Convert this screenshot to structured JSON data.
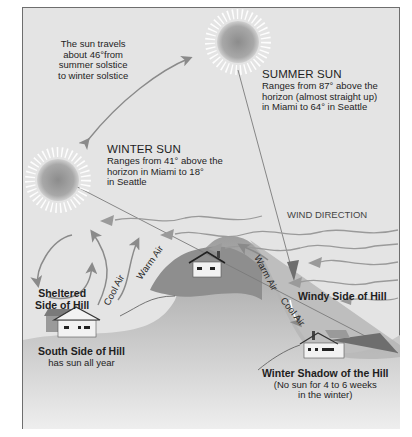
{
  "diagram": {
    "travel_note": [
      "The sun travels",
      "about 46°from",
      "summer solstice",
      "to winter solstice"
    ],
    "summer_sun": {
      "title": "SUMMER SUN",
      "lines": [
        "Ranges from 87° above the",
        "horizon (almost straight up)",
        "in Miami to 64° in Seattle"
      ]
    },
    "winter_sun": {
      "title": "WINTER SUN",
      "lines": [
        "Ranges from 41° above the",
        "horizon in Miami to 18°",
        "in Seattle"
      ]
    },
    "wind_direction": "WIND DIRECTION",
    "air_labels": {
      "warm_air_left": "Warm Air",
      "cool_air_left": "Cool Air",
      "warm_air_right": "Warm Air",
      "cool_air_right": "Cool Air"
    },
    "sheltered": [
      "Sheltered",
      "Side of Hill"
    ],
    "south_side": {
      "title": "South Side of Hill",
      "sub": "has sun all year"
    },
    "windy_side": "Windy Side of Hill",
    "winter_shadow": {
      "title": "Winter Shadow of the Hill",
      "lines": [
        "(No sun for 4 to 6 weeks",
        "in the winter)"
      ]
    },
    "colors": {
      "sky": "#e4e4e4",
      "ground": "#a9a9a9",
      "hill": "#8f8f8f",
      "arrow": "#8a8a8a",
      "sun_core": "#9a9a9a",
      "text": "#1e1e1e"
    }
  }
}
